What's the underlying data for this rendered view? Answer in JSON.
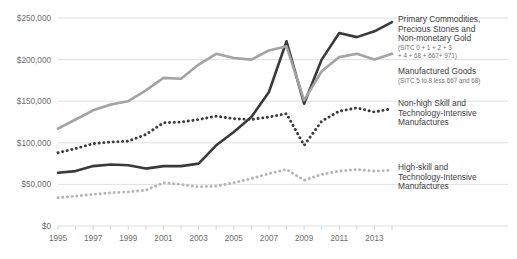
{
  "chart_data": {
    "type": "line",
    "title": "",
    "xlabel": "",
    "ylabel": "",
    "x": [
      1995,
      1996,
      1997,
      1998,
      1999,
      2000,
      2001,
      2002,
      2003,
      2004,
      2005,
      2006,
      2007,
      2008,
      2009,
      2010,
      2011,
      2012,
      2013,
      2014
    ],
    "xlim": [
      1995,
      2014
    ],
    "ylim": [
      0,
      250000
    ],
    "grid": true,
    "legend_position": "right",
    "x_tick_labels": [
      "1995",
      "1997",
      "1999",
      "2001",
      "2003",
      "2005",
      "2007",
      "2009",
      "2011",
      "2013"
    ],
    "y_tick_labels": [
      "$0",
      "$50,000",
      "$100,000",
      "$150,000",
      "$200,000",
      "$250,000"
    ],
    "y_ticks": [
      0,
      50000,
      100000,
      150000,
      200000,
      250000
    ],
    "series": [
      {
        "name": "Primary Commodities, Precious Stones and Non-monetary Gold",
        "sublabel": "(SITC 0 + 1 + 2 + 3 + 4 + 68 + 667+ 971)",
        "style": "solid",
        "color": "#3a3a3a",
        "width": 2.6,
        "values": [
          64000,
          66000,
          72000,
          74000,
          73000,
          69000,
          72000,
          72000,
          75000,
          97000,
          113000,
          131000,
          161000,
          222000,
          147000,
          200000,
          232000,
          227000,
          234000,
          245000
        ]
      },
      {
        "name": "Manufactured Goods",
        "sublabel": "(SITC 5 to 8 less 667 and 68)",
        "style": "solid",
        "color": "#a3a3a3",
        "width": 2.6,
        "values": [
          117000,
          128000,
          139000,
          146000,
          150000,
          163000,
          178000,
          177000,
          194000,
          207000,
          202000,
          200000,
          211000,
          216000,
          151000,
          186000,
          203000,
          207000,
          200000,
          207000
        ]
      },
      {
        "name": "Non-high Skill and Technology-Intensive Manufactures",
        "sublabel": "",
        "style": "dotted",
        "color": "#3a3a3a",
        "width": 2.9,
        "values": [
          88000,
          93000,
          99000,
          101000,
          102000,
          110000,
          124000,
          125000,
          128000,
          132000,
          129000,
          128000,
          131000,
          135000,
          97000,
          126000,
          138000,
          142000,
          137000,
          141000
        ]
      },
      {
        "name": "High-skill and Technology-Intensive Manufactures",
        "sublabel": "",
        "style": "dotted",
        "color": "#b4b4b4",
        "width": 2.9,
        "values": [
          34000,
          36000,
          38000,
          40000,
          41000,
          43000,
          52000,
          50000,
          47000,
          48000,
          52000,
          57000,
          63000,
          68000,
          55000,
          62000,
          66000,
          68000,
          66000,
          67000
        ]
      }
    ],
    "legend": [
      {
        "label_lines": [
          "Primary Commodities,",
          "Precious Stones and",
          "Non-monetary Gold"
        ],
        "sub_lines": [
          "(SITC 0 + 1 + 2 + 3",
          "+ 4 + 68 + 667+ 971)"
        ]
      },
      {
        "label_lines": [
          "Manufactured Goods"
        ],
        "sub_lines": [
          "(SITC 5 to 8 less 667 and 68)"
        ]
      },
      {
        "label_lines": [
          "Non-high Skill and",
          "Technology-Intensive",
          "Manufactures"
        ],
        "sub_lines": []
      },
      {
        "label_lines": [
          "High-skill and",
          "Technology-Intensive",
          "Manufactures"
        ],
        "sub_lines": []
      }
    ],
    "colors": {
      "grid": "#dcdcdc",
      "axis_text": "#6d6d6d",
      "legend_text": "#3d3d3d",
      "legend_sub_text": "#6f6f6f",
      "background": "#ffffff"
    }
  }
}
